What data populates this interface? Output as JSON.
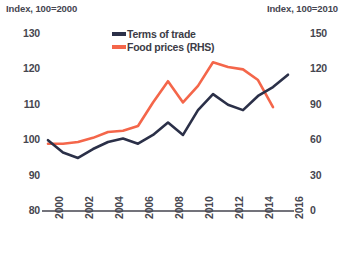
{
  "axes": {
    "left_unit_label": "Index, 100=2000",
    "right_unit_label": "Index, 100=2010",
    "left_ticks": [
      "130",
      "120",
      "110",
      "100",
      "90",
      "80"
    ],
    "right_ticks": [
      "150",
      "120",
      "90",
      "60",
      "30",
      "0"
    ],
    "x_ticks": [
      "2000",
      "2002",
      "2004",
      "2006",
      "2008",
      "2010",
      "2012",
      "2014",
      "2016"
    ]
  },
  "legend": {
    "items": [
      {
        "label": "Terms of trade",
        "color": "#2b3048"
      },
      {
        "label": "Food prices (RHS)",
        "color": "#f4664a"
      }
    ]
  },
  "colors": {
    "terms_of_trade": "#2b3048",
    "food_prices": "#f4664a",
    "axis": "#45454f",
    "background": "#ffffff"
  },
  "chart_data": {
    "type": "line",
    "title": "",
    "xlabel": "",
    "ylabel": "Index, 100=2000",
    "y2label": "Index, 100=2010",
    "xlim": [
      2000,
      2016
    ],
    "ylim": [
      80,
      130
    ],
    "y2lim": [
      0,
      150
    ],
    "grid": false,
    "legend_position": "top-center",
    "x": [
      2000,
      2001,
      2002,
      2003,
      2004,
      2005,
      2006,
      2007,
      2008,
      2009,
      2010,
      2011,
      2012,
      2013,
      2014,
      2015,
      2016
    ],
    "series": [
      {
        "name": "Terms of trade",
        "axis": "left",
        "color": "#2b3048",
        "values": [
          100.0,
          96.5,
          95.0,
          97.5,
          99.5,
          100.5,
          99.0,
          101.5,
          105.0,
          101.5,
          108.5,
          113.0,
          110.0,
          108.5,
          112.5,
          115.0,
          118.5
        ]
      },
      {
        "name": "Food prices (RHS)",
        "axis": "right",
        "color": "#f4664a",
        "values": [
          57.0,
          57.0,
          58.5,
          62.0,
          67.0,
          68.0,
          72.0,
          92.0,
          110.0,
          92.0,
          106.0,
          126.0,
          122.0,
          120.0,
          111.0,
          88.0,
          null
        ]
      }
    ]
  }
}
